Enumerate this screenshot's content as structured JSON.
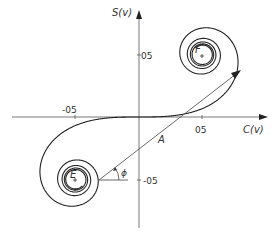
{
  "diagram": {
    "type": "cornu-spiral",
    "axes": {
      "x_label": "C(v)",
      "y_label": "S(v)",
      "x_ticks": [
        {
          "value": -0.5,
          "label": "-05"
        },
        {
          "value": 0.5,
          "label": "05"
        }
      ],
      "y_ticks": [
        {
          "value": 0.5,
          "label": "05"
        },
        {
          "value": -0.5,
          "label": "-05"
        }
      ]
    },
    "points": {
      "E": {
        "label": "E",
        "x": -0.5,
        "y": -0.5
      },
      "F": {
        "label": "F",
        "x": 0.5,
        "y": 0.5
      }
    },
    "vector_label": "A",
    "angle_label": "ϕ",
    "colors": {
      "line": "#222222",
      "axis": "#555555",
      "text": "#333333",
      "background": "#ffffff"
    }
  }
}
